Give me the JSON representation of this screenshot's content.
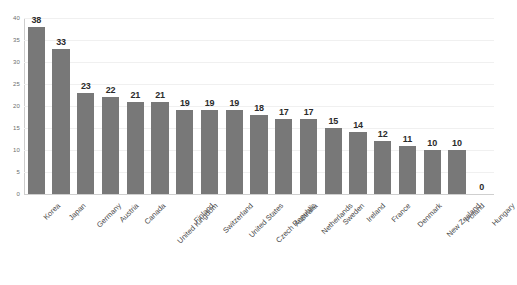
{
  "chart_data": {
    "type": "bar",
    "title": "",
    "subtitle": "",
    "xlabel": "",
    "ylabel": "",
    "ylim": [
      0,
      40
    ],
    "ytick_step": 5,
    "yticks": [
      0,
      5,
      10,
      15,
      20,
      25,
      30,
      35,
      40
    ],
    "grid": true,
    "legend": false,
    "legend_position": "none",
    "bar_color": "#787878",
    "gridline_color": "#f0f0f0",
    "axis_color": "#cdcdcd",
    "label_color": "#2b2b2b",
    "categories": [
      "Korea",
      "Japan",
      "Germany",
      "Austria",
      "Canada",
      "United Kingdom",
      "Finland",
      "Switzerland",
      "United States",
      "Czech Republic",
      "Australia",
      "Netherlands",
      "Sweden",
      "Ireland",
      "France",
      "Denmark",
      "New Zealand",
      "Poland",
      "Hungary"
    ],
    "values": [
      38,
      33,
      23,
      22,
      21,
      21,
      19,
      19,
      19,
      18,
      17,
      17,
      15,
      14,
      12,
      11,
      10,
      10,
      0
    ],
    "data_labels": [
      "38",
      "33",
      "23",
      "22",
      "21",
      "21",
      "19",
      "19",
      "19",
      "18",
      "17",
      "17",
      "15",
      "14",
      "12",
      "11",
      "10",
      "10",
      "0"
    ]
  }
}
